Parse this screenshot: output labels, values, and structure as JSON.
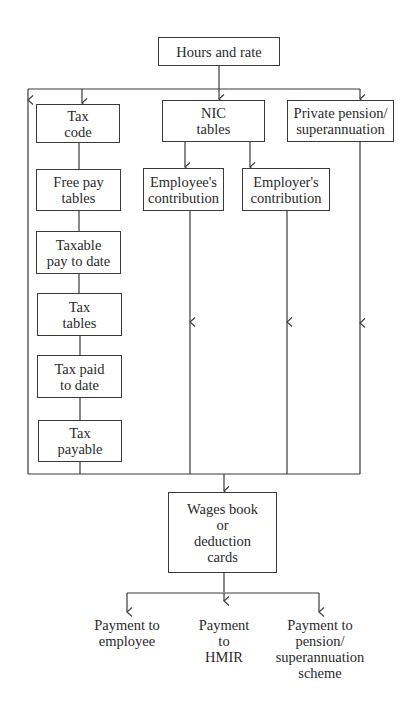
{
  "diagram": {
    "top": "Hours and rate",
    "tax_column": [
      "Tax\ncode",
      "Free pay\ntables",
      "Taxable\npay to date",
      "Tax\ntables",
      "Tax paid\nto date",
      "Tax\npayable"
    ],
    "nic": "NIC\ntables",
    "employee_contribution": "Employee's\ncontribution",
    "employer_contribution": "Employer's\ncontribution",
    "private_pension": "Private pension/\nsuperannuation",
    "wages_book": "Wages book\nor\ndeduction\ncards",
    "outputs": [
      "Payment to\nemployee",
      "Payment\nto\nHMIR",
      "Payment to\npension/\nsuperannuation\nscheme"
    ]
  }
}
